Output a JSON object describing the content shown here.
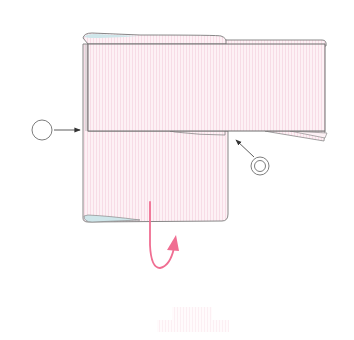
{
  "diagram": {
    "type": "folding-instruction",
    "colors": {
      "ribbon_fill": "#fdf0f4",
      "ribbon_stripe": "#f6d9e3",
      "outline": "#7a7a7a",
      "edge_tint": "#cfe6ea",
      "fold_arrow": "#f06e92",
      "marker_stroke": "#6e6e6e",
      "background": "#ffffff"
    },
    "markers": [
      {
        "id": "marker-1",
        "style": "single-circle",
        "label": ""
      },
      {
        "id": "marker-2",
        "style": "double-circle",
        "label": ""
      }
    ],
    "fold_arrow": {
      "direction": "fold-up-behind"
    },
    "ghost_block": {
      "description": "faint pink striped preview"
    }
  }
}
